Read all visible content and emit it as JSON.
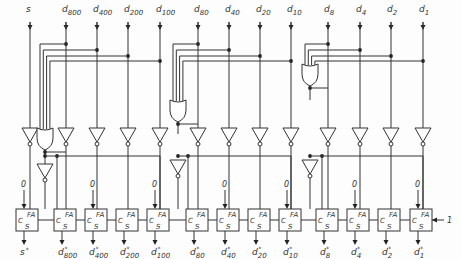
{
  "diagram": {
    "inputs": [
      {
        "id": "s",
        "label": "s",
        "sub": "",
        "x": 30
      },
      {
        "id": "d800",
        "label": "d",
        "sub": "800",
        "x": 66
      },
      {
        "id": "d400",
        "label": "d",
        "sub": "400",
        "x": 97
      },
      {
        "id": "d200",
        "label": "d",
        "sub": "200",
        "x": 128
      },
      {
        "id": "d100",
        "label": "d",
        "sub": "100",
        "x": 160
      },
      {
        "id": "d80",
        "label": "d",
        "sub": "80",
        "x": 198
      },
      {
        "id": "d40",
        "label": "d",
        "sub": "40",
        "x": 229
      },
      {
        "id": "d20",
        "label": "d",
        "sub": "20",
        "x": 260
      },
      {
        "id": "d10",
        "label": "d",
        "sub": "10",
        "x": 291
      },
      {
        "id": "d8",
        "label": "d",
        "sub": "8",
        "x": 328
      },
      {
        "id": "d4",
        "label": "d",
        "sub": "4",
        "x": 360
      },
      {
        "id": "d2",
        "label": "d",
        "sub": "2",
        "x": 391
      },
      {
        "id": "d1",
        "label": "d",
        "sub": "1",
        "x": 423
      }
    ],
    "outputs": [
      {
        "label": "s",
        "sub": "",
        "x": 24
      },
      {
        "label": "d",
        "sub": "800",
        "x": 62
      },
      {
        "label": "d",
        "sub": "400",
        "x": 93
      },
      {
        "label": "d",
        "sub": "200",
        "x": 124
      },
      {
        "label": "d",
        "sub": "100",
        "x": 155
      },
      {
        "label": "d",
        "sub": "80",
        "x": 194
      },
      {
        "label": "d",
        "sub": "40",
        "x": 225
      },
      {
        "label": "d",
        "sub": "20",
        "x": 256
      },
      {
        "label": "d",
        "sub": "10",
        "x": 287
      },
      {
        "label": "d",
        "sub": "8",
        "x": 324
      },
      {
        "label": "d",
        "sub": "4",
        "x": 355
      },
      {
        "label": "d",
        "sub": "2",
        "x": 386
      },
      {
        "label": "d",
        "sub": "1",
        "x": 418
      }
    ],
    "output_mark": "*",
    "adder": {
      "top_label": "FA",
      "carry_label": "C",
      "sum_label": "S"
    },
    "constant_zero": "0",
    "carry_in_label": "1"
  }
}
